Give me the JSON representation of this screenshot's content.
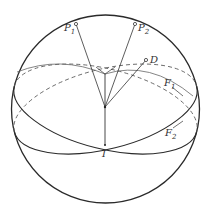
{
  "diagram": {
    "type": "sphere-great-circles",
    "labels": {
      "p1": "P",
      "p1_sub": "1",
      "p2": "P",
      "p2_sub": "2",
      "d": "D",
      "f1": "F",
      "f1_sub": "1",
      "f2": "F",
      "f2_sub": "2",
      "i": "I"
    },
    "colors": {
      "stroke": "#2a2a2a",
      "background": "#ffffff"
    }
  }
}
